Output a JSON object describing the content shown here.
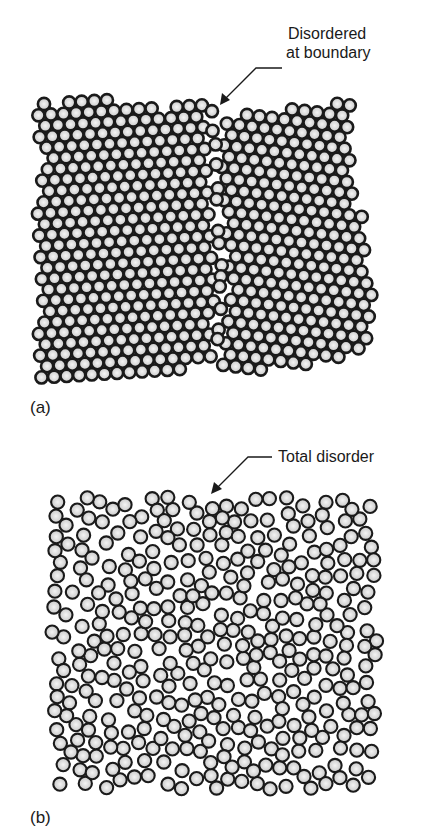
{
  "figure": {
    "panels": [
      {
        "id": "a",
        "label": "(a)",
        "annotation": [
          "Disordered",
          "at boundary"
        ],
        "description": "Two crystalline grains of close-packed atoms meeting at a disordered grain boundary"
      },
      {
        "id": "b",
        "label": "(b)",
        "annotation": [
          "Total disorder"
        ],
        "description": "Amorphous arrangement of atoms with no long-range order"
      }
    ],
    "atom_style": {
      "fill_center": "#f4f4f4",
      "fill_edge": "#c8c8c8",
      "stroke": "#1a1a1a"
    }
  }
}
